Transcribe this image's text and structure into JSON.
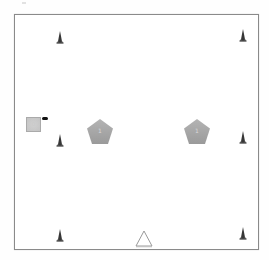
{
  "scene": {
    "width": 269,
    "height": 260,
    "background": "#ffffff",
    "arena": {
      "x": 14,
      "y": 14,
      "w": 243,
      "h": 234,
      "border_color": "#8a8a8a"
    }
  },
  "colors": {
    "cone": "#2e2e2e",
    "cone_highlight": "#6a6a6a",
    "pentagon_fill": "#9a9a9a",
    "pentagon_top": "#b4b4b4",
    "square_fill": "#c4c4c4",
    "square_border": "#aaaaaa",
    "marker": "#111111",
    "triangle_stroke": "#9a9a9a",
    "triangle_fill": "#ffffff"
  },
  "cones": [
    {
      "id": "cone-top-left",
      "x": 60,
      "y": 37
    },
    {
      "id": "cone-top-right",
      "x": 243,
      "y": 35
    },
    {
      "id": "cone-mid-left",
      "x": 60,
      "y": 140
    },
    {
      "id": "cone-mid-right",
      "x": 243,
      "y": 137
    },
    {
      "id": "cone-bottom-left",
      "x": 60,
      "y": 235
    },
    {
      "id": "cone-bottom-right",
      "x": 243,
      "y": 233
    }
  ],
  "pentagons": [
    {
      "id": "pentagon-left",
      "x": 100,
      "y": 132,
      "size": 28,
      "label": "1"
    },
    {
      "id": "pentagon-right",
      "x": 197,
      "y": 132,
      "size": 28,
      "label": "1"
    }
  ],
  "square": {
    "id": "square-block",
    "x": 26,
    "y": 117,
    "size": 15,
    "label": "0"
  },
  "marker": {
    "id": "black-marker",
    "x": 42,
    "y": 117,
    "w": 6,
    "h": 3
  },
  "triangle": {
    "id": "triangle-outline",
    "x": 143,
    "y": 238,
    "size": 16
  }
}
